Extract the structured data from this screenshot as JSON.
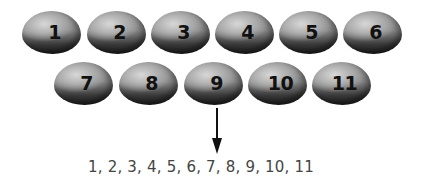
{
  "eggs": {
    "row1": [
      {
        "label": "1",
        "x": 22,
        "y": 11
      },
      {
        "label": "2",
        "x": 87,
        "y": 11
      },
      {
        "label": "3",
        "x": 151,
        "y": 11
      },
      {
        "label": "4",
        "x": 215,
        "y": 11
      },
      {
        "label": "5",
        "x": 279,
        "y": 11
      },
      {
        "label": "6",
        "x": 343,
        "y": 11
      }
    ],
    "row2": [
      {
        "label": "7",
        "x": 54,
        "y": 62
      },
      {
        "label": "8",
        "x": 119,
        "y": 62
      },
      {
        "label": "9",
        "x": 184,
        "y": 62
      },
      {
        "label": "10",
        "x": 248,
        "y": 62
      },
      {
        "label": "11",
        "x": 312,
        "y": 62
      }
    ]
  },
  "arrow": {
    "direction": "down",
    "from_egg": "9"
  },
  "sequence_text": "1, 2, 3, 4, 5, 6, 7, 8, 9, 10, 11",
  "colors": {
    "egg_light": "#d8d8d8",
    "egg_dark": "#1e1e1e",
    "arrow": "#111111",
    "text": "#444444"
  }
}
